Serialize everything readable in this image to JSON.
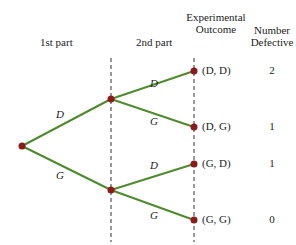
{
  "headers": {
    "first_part": "1st part",
    "second_part": "2nd part",
    "outcome_line1": "Experimental",
    "outcome_line2": "Outcome",
    "defective_line1": "Number",
    "defective_line2": "Defective"
  },
  "colors": {
    "branch": "#4f8a2e",
    "node": "#8b1a1a",
    "dashed": "#333333",
    "text": "#222222"
  },
  "first_branches": [
    {
      "label": "D"
    },
    {
      "label": "G"
    }
  ],
  "second_branches": [
    {
      "label": "D"
    },
    {
      "label": "G"
    },
    {
      "label": "D"
    },
    {
      "label": "G"
    }
  ],
  "outcomes": [
    {
      "outcome": "(D, D)",
      "defective": "2"
    },
    {
      "outcome": "(D, G)",
      "defective": "1"
    },
    {
      "outcome": "(G, D)",
      "defective": "1"
    },
    {
      "outcome": "(G, G)",
      "defective": "0"
    }
  ]
}
